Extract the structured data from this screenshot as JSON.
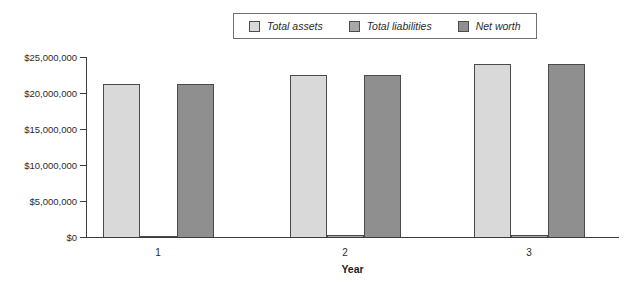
{
  "chart_data": {
    "type": "bar",
    "title": "",
    "xlabel": "Year",
    "ylabel": "",
    "categories": [
      "1",
      "2",
      "3"
    ],
    "series": [
      {
        "name": "Total assets",
        "color": "#d9d9d9",
        "values": [
          21300000,
          22500000,
          24000000
        ]
      },
      {
        "name": "Total liabilities",
        "color": "#a8a8a8",
        "values": [
          100000,
          250000,
          300000
        ]
      },
      {
        "name": "Net worth",
        "color": "#8f8f8f",
        "values": [
          21300000,
          22500000,
          24000000
        ]
      }
    ],
    "ylim": [
      0,
      25000000
    ],
    "ytick_values": [
      25000000,
      20000000,
      15000000,
      10000000,
      5000000,
      0
    ],
    "ytick_labels": [
      "$25,000,000",
      "$20,000,000",
      "$15,000,000",
      "$10,000,000",
      "$5,000,000",
      "$0"
    ],
    "grid": false,
    "legend_position": "top-center",
    "bar_border_color": "#4a4a4a",
    "axis_color": "#3c3c3c"
  }
}
